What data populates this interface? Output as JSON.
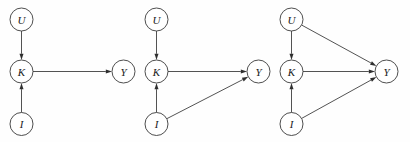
{
  "figure": {
    "type": "diagram",
    "diagram_kind": "directed-acyclic-graph",
    "background_color": "#fefefe",
    "stroke_color": "#3f3f3f",
    "node_fill": "#ffffff",
    "label_color": "#1a1a1a",
    "panel_count": 3,
    "node_radius": 11.5
  },
  "panels": [
    {
      "id": "panel-1",
      "nodes": [
        {
          "id": "U",
          "label": "U",
          "cx": 21.5,
          "cy": 19.5
        },
        {
          "id": "K",
          "label": "K",
          "cx": 21.5,
          "cy": 71.5
        },
        {
          "id": "I",
          "label": "I",
          "cx": 21.5,
          "cy": 124.0
        },
        {
          "id": "Y",
          "label": "Y",
          "cx": 123.5,
          "cy": 71.5
        }
      ],
      "edges": [
        {
          "from": "U",
          "to": "K"
        },
        {
          "from": "I",
          "to": "K"
        },
        {
          "from": "K",
          "to": "Y"
        }
      ]
    },
    {
      "id": "panel-2",
      "nodes": [
        {
          "id": "U",
          "label": "U",
          "cx": 156.5,
          "cy": 19.5
        },
        {
          "id": "K",
          "label": "K",
          "cx": 156.5,
          "cy": 71.5
        },
        {
          "id": "I",
          "label": "I",
          "cx": 156.5,
          "cy": 124.0
        },
        {
          "id": "Y",
          "label": "Y",
          "cx": 258.5,
          "cy": 71.5
        }
      ],
      "edges": [
        {
          "from": "U",
          "to": "K"
        },
        {
          "from": "I",
          "to": "K"
        },
        {
          "from": "K",
          "to": "Y"
        },
        {
          "from": "I",
          "to": "Y"
        }
      ]
    },
    {
      "id": "panel-3",
      "nodes": [
        {
          "id": "U",
          "label": "U",
          "cx": 291.5,
          "cy": 19.5
        },
        {
          "id": "K",
          "label": "K",
          "cx": 291.5,
          "cy": 71.5
        },
        {
          "id": "I",
          "label": "I",
          "cx": 291.5,
          "cy": 124.0
        },
        {
          "id": "Y",
          "label": "Y",
          "cx": 386.5,
          "cy": 71.5
        }
      ],
      "edges": [
        {
          "from": "U",
          "to": "K"
        },
        {
          "from": "I",
          "to": "K"
        },
        {
          "from": "K",
          "to": "Y"
        },
        {
          "from": "I",
          "to": "Y"
        },
        {
          "from": "U",
          "to": "Y"
        }
      ]
    }
  ]
}
